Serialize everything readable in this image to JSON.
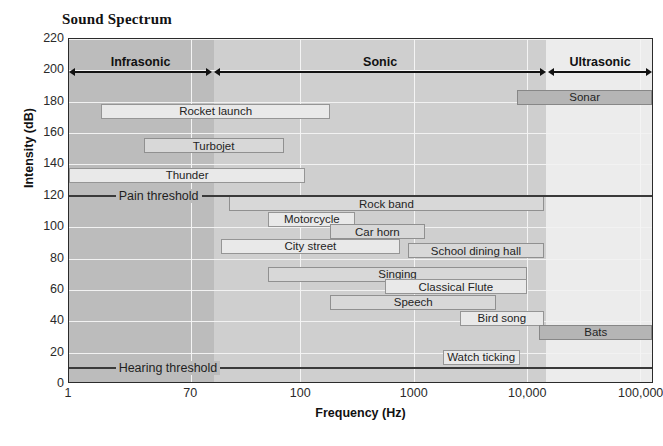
{
  "chart_data": {
    "type": "bar",
    "title": "Sound Spectrum",
    "xlabel": "Frequency (Hz)",
    "ylabel": "Intensity (dB)",
    "xscale": "log",
    "xlim": [
      1,
      200000
    ],
    "ylim": [
      0,
      220
    ],
    "grid": true,
    "legend": "none",
    "xticks": [
      {
        "label": "1",
        "value": 1,
        "pos_pct": 0
      },
      {
        "label": "70",
        "value": 70,
        "pos_pct": 20.9
      },
      {
        "label": "100",
        "value": 100,
        "pos_pct": 39.7
      },
      {
        "label": "1000",
        "value": 1000,
        "pos_pct": 59.1
      },
      {
        "label": "10,000",
        "value": 10000,
        "pos_pct": 78.5
      },
      {
        "label": "100,000",
        "value": 100000,
        "pos_pct": 97.9
      }
    ],
    "yticks": [
      {
        "label": "220",
        "value": 220
      },
      {
        "label": "200",
        "value": 200
      },
      {
        "label": "180",
        "value": 180
      },
      {
        "label": "160",
        "value": 160
      },
      {
        "label": "140",
        "value": 140
      },
      {
        "label": "120",
        "value": 120
      },
      {
        "label": "100",
        "value": 100
      },
      {
        "label": "80",
        "value": 80
      },
      {
        "label": "60",
        "value": 60
      },
      {
        "label": "40",
        "value": 40
      },
      {
        "label": "20",
        "value": 20
      },
      {
        "label": "0",
        "value": 0
      }
    ],
    "regions": [
      {
        "name": "Infrasonic",
        "start_pct": 0,
        "end_pct": 24.8,
        "shade": "#bcbcbc"
      },
      {
        "name": "Sonic",
        "start_pct": 24.8,
        "end_pct": 81.9,
        "shade": "#cfcfcf"
      },
      {
        "name": "Ultrasonic",
        "start_pct": 81.9,
        "end_pct": 100,
        "shade": "#ececec"
      }
    ],
    "thresholds": [
      {
        "name": "Pain threshold",
        "db": 120,
        "label_x_pct": 8
      },
      {
        "name": "Hearing threshold",
        "db": 10,
        "label_x_pct": 8
      }
    ],
    "bars": [
      {
        "name": "Sonar",
        "db": 183,
        "x0_pct": 76.9,
        "x1_pct": 100.0,
        "shade": "dark"
      },
      {
        "name": "Rocket launch",
        "db": 174,
        "x0_pct": 5.5,
        "x1_pct": 44.8,
        "shade": "light"
      },
      {
        "name": "Turbojet",
        "db": 152,
        "x0_pct": 12.8,
        "x1_pct": 36.8,
        "shade": "mid"
      },
      {
        "name": "Thunder",
        "db": 133,
        "x0_pct": 0.0,
        "x1_pct": 40.5,
        "shade": "light"
      },
      {
        "name": "Rock band",
        "db": 115,
        "x0_pct": 27.4,
        "x1_pct": 81.5,
        "shade": "mid"
      },
      {
        "name": "Motorcycle",
        "db": 105,
        "x0_pct": 34.2,
        "x1_pct": 49.1,
        "shade": "light"
      },
      {
        "name": "Car horn",
        "db": 97,
        "x0_pct": 44.8,
        "x1_pct": 61.0,
        "shade": "mid"
      },
      {
        "name": "City street",
        "db": 88,
        "x0_pct": 26.0,
        "x1_pct": 56.8,
        "shade": "light"
      },
      {
        "name": "School dining hall",
        "db": 85,
        "x0_pct": 58.1,
        "x1_pct": 81.5,
        "shade": "mid"
      },
      {
        "name": "Singing",
        "db": 70,
        "x0_pct": 34.2,
        "x1_pct": 78.5,
        "shade": "mid"
      },
      {
        "name": "Classical Flute",
        "db": 62,
        "x0_pct": 54.2,
        "x1_pct": 78.5,
        "shade": "light"
      },
      {
        "name": "Speech",
        "db": 52,
        "x0_pct": 44.8,
        "x1_pct": 73.3,
        "shade": "mid"
      },
      {
        "name": "Bird song",
        "db": 42,
        "x0_pct": 67.0,
        "x1_pct": 81.5,
        "shade": "light"
      },
      {
        "name": "Bats",
        "db": 33,
        "x0_pct": 80.7,
        "x1_pct": 100.0,
        "shade": "dark"
      },
      {
        "name": "Watch ticking",
        "db": 17,
        "x0_pct": 64.1,
        "x1_pct": 77.3,
        "shade": "light"
      }
    ]
  }
}
